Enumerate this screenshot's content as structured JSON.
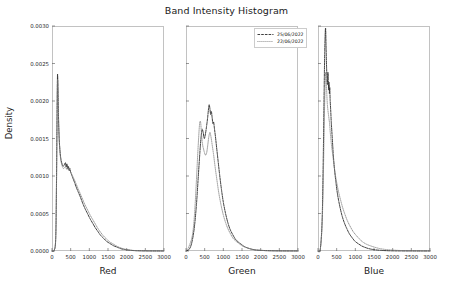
{
  "chart_data": {
    "type": "line",
    "title": "Band Intensity Histogram",
    "ylabel": "Density",
    "xlabel": "",
    "xlim": [
      0,
      3000
    ],
    "ylim": [
      0.0,
      0.003
    ],
    "grid": false,
    "legend_position": "upper right of center panel",
    "xticks": [
      0,
      500,
      1000,
      1500,
      2000,
      2500,
      3000
    ],
    "xtick_labels": [
      "0",
      "500",
      "1000",
      "1500",
      "2000",
      "2500",
      "3000"
    ],
    "yticks": [
      0.0,
      0.0005,
      0.001,
      0.0015,
      0.002,
      0.0025,
      0.003
    ],
    "ytick_labels": [
      "0.0000",
      "0.0005",
      "0.0010",
      "0.0015",
      "0.0020",
      "0.0025",
      "0.0030"
    ],
    "legend": [
      {
        "name": "25/06/2022",
        "linestyle": "dashed",
        "color": "#2a2a2a"
      },
      {
        "name": "22/06/2022",
        "linestyle": "dotted",
        "color": "#6e6e6e"
      }
    ],
    "panels": [
      {
        "xlabel": "Red",
        "series": [
          {
            "name": "25/06/2022",
            "linestyle": "dashed",
            "color": "#2a2a2a",
            "x": [
              0,
              60,
              100,
              120,
              135,
              145,
              150,
              160,
              175,
              195,
              215,
              240,
              270,
              300,
              330,
              360,
              380,
              400,
              420,
              440,
              460,
              480,
              500,
              530,
              560,
              600,
              650,
              700,
              760,
              820,
              880,
              950,
              1020,
              1090,
              1160,
              1230,
              1300,
              1380,
              1460,
              1550,
              1650,
              1750,
              1850,
              1950,
              2050,
              2150,
              2250,
              2400,
              2600,
              2800,
              3000
            ],
            "y": [
              0.0,
              1e-05,
              0.00018,
              0.0009,
              0.0018,
              0.00228,
              0.00235,
              0.00218,
              0.00176,
              0.00148,
              0.00133,
              0.00122,
              0.00116,
              0.00113,
              0.00115,
              0.00118,
              0.00112,
              0.00116,
              0.0011,
              0.00113,
              0.00107,
              0.0011,
              0.00105,
              0.00101,
              0.00097,
              0.00092,
              0.00085,
              0.00079,
              0.00072,
              0.00064,
              0.00057,
              0.0005,
              0.00043,
              0.00037,
              0.00031,
              0.00026,
              0.00021,
              0.00017,
              0.00013,
              0.0001,
              7e-05,
              5e-05,
              3e-05,
              2e-05,
              1.2e-05,
              7e-06,
              4e-06,
              2e-06,
              1e-06,
              5e-07,
              2e-07
            ]
          },
          {
            "name": "22/06/2022",
            "linestyle": "dotted",
            "color": "#787878",
            "x": [
              0,
              60,
              100,
              120,
              135,
              145,
              155,
              165,
              180,
              200,
              220,
              245,
              275,
              305,
              335,
              365,
              390,
              415,
              440,
              465,
              495,
              525,
              560,
              600,
              650,
              700,
              760,
              820,
              880,
              950,
              1020,
              1090,
              1160,
              1230,
              1300,
              1380,
              1460,
              1550,
              1650,
              1750,
              1850,
              1950,
              2050,
              2150,
              2250,
              2400,
              2600,
              2800,
              3000
            ],
            "y": [
              0.0,
              1e-05,
              0.00016,
              0.00084,
              0.00172,
              0.00222,
              0.00226,
              0.00206,
              0.00168,
              0.00142,
              0.00128,
              0.00119,
              0.00113,
              0.0011,
              0.00111,
              0.00113,
              0.00109,
              0.00111,
              0.00108,
              0.00109,
              0.00106,
              0.00103,
              0.00099,
              0.00095,
              0.00089,
              0.00083,
              0.00076,
              0.00069,
              0.00062,
              0.00055,
              0.00048,
              0.00042,
              0.00036,
              0.0003,
              0.00025,
              0.0002,
              0.00016,
              0.00012,
              9e-05,
              6e-05,
              4e-05,
              2.5e-05,
              1.5e-05,
              9e-06,
              5e-06,
              3e-06,
              1e-06,
              6e-07,
              2e-07
            ]
          }
        ]
      },
      {
        "xlabel": "Green",
        "series": [
          {
            "name": "25/06/2022",
            "linestyle": "dashed",
            "color": "#2a2a2a",
            "x": [
              0,
              80,
              150,
              220,
              280,
              330,
              370,
              400,
              430,
              460,
              490,
              520,
              550,
              580,
              600,
              620,
              640,
              660,
              680,
              700,
              720,
              740,
              760,
              790,
              820,
              860,
              900,
              950,
              1000,
              1060,
              1120,
              1180,
              1250,
              1320,
              1400,
              1480,
              1560,
              1650,
              1750,
              1850,
              1950,
              2050,
              2200,
              2400,
              2600,
              2800,
              3000
            ],
            "y": [
              0.0,
              2e-05,
              0.0001,
              0.0003,
              0.00062,
              0.001,
              0.0013,
              0.0015,
              0.00162,
              0.00158,
              0.0015,
              0.00156,
              0.00166,
              0.00178,
              0.00188,
              0.00195,
              0.0019,
              0.00182,
              0.00186,
              0.00178,
              0.0017,
              0.00172,
              0.00164,
              0.00152,
              0.00138,
              0.0012,
              0.00102,
              0.00082,
              0.00065,
              0.0005,
              0.00038,
              0.00029,
              0.00022,
              0.00016,
              0.00012,
              9e-05,
              6e-05,
              4e-05,
              2.5e-05,
              1.5e-05,
              1e-05,
              7e-06,
              4e-06,
              2e-06,
              1e-06,
              5e-07,
              2e-07
            ]
          },
          {
            "name": "22/06/2022",
            "linestyle": "dotted",
            "color": "#787878",
            "x": [
              0,
              60,
              110,
              160,
              200,
              240,
              280,
              310,
              340,
              365,
              390,
              410,
              430,
              450,
              470,
              490,
              520,
              550,
              580,
              610,
              640,
              670,
              700,
              740,
              780,
              830,
              880,
              940,
              1000,
              1060,
              1120,
              1190,
              1260,
              1340,
              1420,
              1500,
              1600,
              1700,
              1800,
              1900,
              2050,
              2200,
              2400,
              2600,
              2800,
              3000
            ],
            "y": [
              0.0,
              4e-05,
              0.0001,
              0.00018,
              0.00032,
              0.00058,
              0.00095,
              0.00125,
              0.00152,
              0.0017,
              0.00172,
              0.0016,
              0.00148,
              0.0014,
              0.00136,
              0.00132,
              0.00128,
              0.0013,
              0.0014,
              0.00152,
              0.00158,
              0.00152,
              0.00142,
              0.00128,
              0.00112,
              0.00094,
              0.00077,
              0.00061,
              0.00048,
              0.00038,
              0.0003,
              0.00023,
              0.00017,
              0.00013,
              0.0001,
              7e-05,
              5e-05,
              3.3e-05,
              2e-05,
              1.3e-05,
              8e-06,
              4e-06,
              2e-06,
              1e-06,
              5e-07,
              2e-07
            ]
          }
        ]
      },
      {
        "xlabel": "Blue",
        "series": [
          {
            "name": "25/06/2022",
            "linestyle": "dashed",
            "color": "#2a2a2a",
            "x": [
              0,
              60,
              110,
              140,
              165,
              180,
              195,
              205,
              215,
              228,
              240,
              252,
              265,
              275,
              285,
              295,
              305,
              315,
              325,
              340,
              355,
              370,
              390,
              410,
              440,
              475,
              510,
              550,
              600,
              650,
              710,
              770,
              840,
              910,
              990,
              1070,
              1160,
              1250,
              1350,
              1450,
              1560,
              1700,
              1850,
              2000,
              2200,
              2500,
              2800,
              3000
            ],
            "y": [
              0.0,
              2e-05,
              0.0004,
              0.0012,
              0.00215,
              0.00265,
              0.00292,
              0.00296,
              0.00275,
              0.00248,
              0.00232,
              0.00222,
              0.00238,
              0.0023,
              0.00215,
              0.00225,
              0.0021,
              0.00218,
              0.00202,
              0.00188,
              0.00172,
              0.0016,
              0.00144,
              0.00128,
              0.0011,
              0.00094,
              0.0008,
              0.00068,
              0.00056,
              0.00046,
              0.00037,
              0.0003,
              0.00023,
              0.00018,
              0.00013,
              0.0001,
              7e-05,
              5e-05,
              3.3e-05,
              2.2e-05,
              1.4e-05,
              8e-06,
              4e-06,
              2e-06,
              1e-06,
              5e-07,
              2e-07,
              1e-07
            ]
          },
          {
            "name": "22/06/2022",
            "linestyle": "dotted",
            "color": "#787878",
            "x": [
              0,
              60,
              110,
              145,
              170,
              190,
              205,
              220,
              235,
              250,
              265,
              280,
              295,
              310,
              325,
              340,
              360,
              380,
              405,
              435,
              470,
              510,
              555,
              605,
              660,
              720,
              790,
              860,
              940,
              1020,
              1110,
              1200,
              1300,
              1400,
              1520,
              1650,
              1800,
              1950,
              2100,
              2300,
              2500,
              2800,
              3000
            ],
            "y": [
              0.0,
              2e-05,
              0.00036,
              0.00105,
              0.00178,
              0.0022,
              0.00238,
              0.00228,
              0.0021,
              0.00196,
              0.00188,
              0.00182,
              0.00176,
              0.0017,
              0.0016,
              0.00152,
              0.00142,
              0.00134,
              0.00124,
              0.00112,
              0.001,
              0.00089,
              0.00078,
              0.00068,
              0.00058,
              0.00049,
              0.0004,
              0.00033,
              0.00026,
              0.00021,
              0.00016,
              0.00012,
              9e-05,
              7e-05,
              5e-05,
              3.3e-05,
              2.1e-05,
              1.4e-05,
              9e-06,
              5e-06,
              3e-06,
              1e-06,
              5e-07
            ]
          }
        ]
      }
    ]
  }
}
